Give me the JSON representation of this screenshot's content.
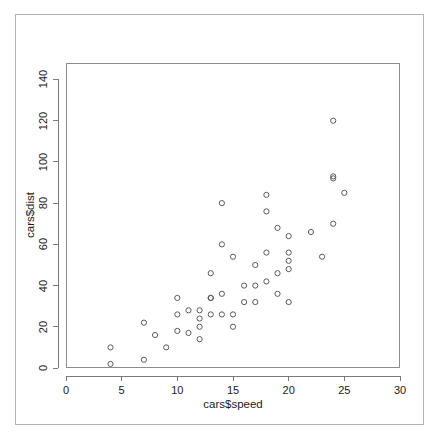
{
  "chart_data": {
    "type": "scatter",
    "title": "",
    "xlabel": "cars$speed",
    "ylabel": "cars$dist",
    "xlim": [
      0,
      30
    ],
    "ylim": [
      0,
      148
    ],
    "grid": false,
    "legend": "none",
    "marker": "open-circle",
    "marker_color": "#5a5a5a",
    "xticks": [
      0,
      5,
      10,
      15,
      20,
      25,
      30
    ],
    "xtick_labels": [
      "0",
      "5",
      "10",
      "15",
      "20",
      "25",
      "30"
    ],
    "yticks": [
      0,
      20,
      40,
      60,
      80,
      100,
      120,
      140
    ],
    "ytick_labels": [
      "0",
      "20",
      "40",
      "60",
      "80",
      "100",
      "120",
      "140"
    ],
    "x": [
      4,
      4,
      7,
      7,
      8,
      9,
      10,
      10,
      10,
      11,
      11,
      12,
      12,
      12,
      12,
      13,
      13,
      13,
      13,
      14,
      14,
      14,
      14,
      15,
      15,
      15,
      16,
      16,
      17,
      17,
      17,
      18,
      18,
      18,
      18,
      19,
      19,
      19,
      20,
      20,
      20,
      20,
      20,
      22,
      23,
      24,
      24,
      24,
      24,
      25
    ],
    "y": [
      2,
      10,
      4,
      22,
      16,
      10,
      18,
      26,
      34,
      17,
      28,
      14,
      20,
      24,
      28,
      26,
      34,
      34,
      46,
      26,
      36,
      60,
      80,
      20,
      26,
      54,
      32,
      40,
      32,
      40,
      50,
      42,
      56,
      76,
      84,
      36,
      46,
      68,
      32,
      48,
      52,
      56,
      64,
      66,
      54,
      70,
      92,
      93,
      120,
      85
    ],
    "point_count": 50,
    "series_name": "cars"
  },
  "figure": {
    "frame_color": "#b2b2b2",
    "plot_box_color": "#8c8c8c",
    "background": "#ffffff"
  }
}
